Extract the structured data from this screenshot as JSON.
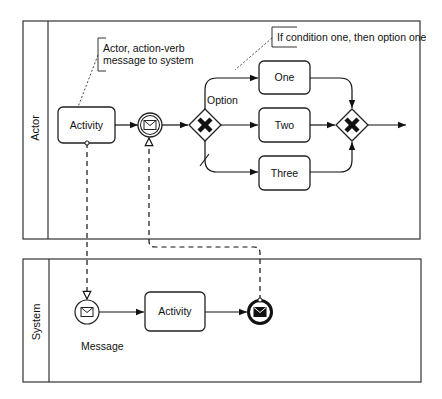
{
  "diagram": {
    "type": "BPMN collaboration",
    "colors": {
      "stroke": "#222222",
      "background": "#ffffff",
      "text": "#111111"
    },
    "pools": [
      {
        "id": "actor",
        "label": "Actor",
        "elements": {
          "annotation_1": "Actor, action-verb",
          "annotation_2": "message to system",
          "activity": "Activity",
          "intermediate_event": "message-intermediate-catch-event",
          "gateway_label": "Option",
          "gateway_condition_annotation": "If condition one, then option one",
          "options": [
            "One",
            "Two",
            "Three"
          ],
          "merge_gateway": "exclusive-gateway"
        }
      },
      {
        "id": "system",
        "label": "System",
        "elements": {
          "start_event": "message-start-event",
          "start_event_label": "Message",
          "activity": "Activity",
          "end_event": "message-end-event"
        }
      }
    ],
    "message_flows": [
      {
        "from": "Actor Activity",
        "to": "System Message start event"
      },
      {
        "from": "System Message end event",
        "to": "Actor intermediate message event"
      }
    ]
  }
}
